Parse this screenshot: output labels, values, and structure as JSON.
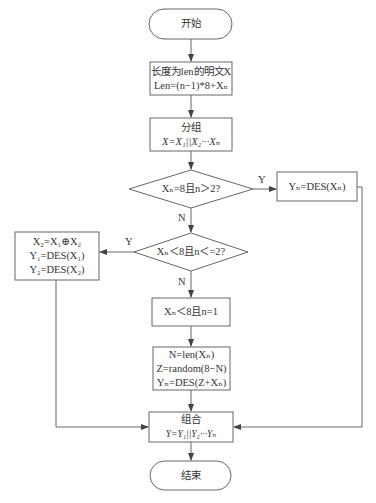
{
  "diagram": {
    "nodes": {
      "start": {
        "label": "开始"
      },
      "input": {
        "line1": "长度为len的明文X",
        "line2": "Len=(n−1)*8+Xₙ"
      },
      "group": {
        "line1": "分组",
        "line2": "X=X₁||X₂···Xₙ"
      },
      "decision1": {
        "label": "Xₙ=8且n＞2?"
      },
      "encrypt_full": {
        "label": "Yₙ=DES(Xₙ)"
      },
      "decision2": {
        "label": "Xₙ＜8且n＜=2?"
      },
      "xor_box": {
        "line1": "X₂=X₁⊕X₂",
        "line2": "Y₁=DES(X₁)",
        "line3": "Y₂=DES(X₂)"
      },
      "short_block": {
        "label": "Xₙ＜8且n=1"
      },
      "pad_box": {
        "line1": "N=len(Xₙ)",
        "line2": "Z=random(8−N)",
        "line3": "Yₙ=DES(Z+Xₙ)"
      },
      "combine": {
        "line1": "组合",
        "line2": "Y=Y₁||Y₂···Yₙ"
      },
      "end": {
        "label": "结束"
      }
    },
    "edge_labels": {
      "d1_yes": "Y",
      "d1_no": "N",
      "d2_yes": "Y",
      "d2_no": "N"
    },
    "colors": {
      "stroke": "#555555",
      "text": "#333333",
      "background": "#ffffff"
    }
  }
}
